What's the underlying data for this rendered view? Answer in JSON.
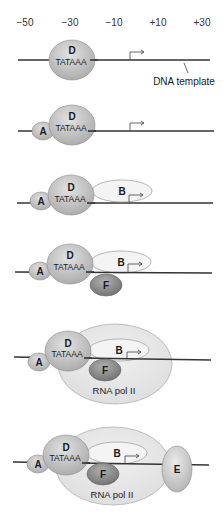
{
  "diagram": {
    "positions": [
      "−50",
      "−30",
      "−10",
      "+10",
      "+30"
    ],
    "dna_label": "DNA template",
    "tata_label": "TATAAA",
    "factors": {
      "A": "A",
      "B": "B",
      "D": "D",
      "E": "E",
      "F": "F",
      "pol": "RNA pol II"
    },
    "steps": [
      {
        "step": 1,
        "components": [
          "D"
        ]
      },
      {
        "step": 2,
        "components": [
          "A",
          "D"
        ]
      },
      {
        "step": 3,
        "components": [
          "A",
          "D",
          "B"
        ]
      },
      {
        "step": 4,
        "components": [
          "A",
          "D",
          "B",
          "F"
        ]
      },
      {
        "step": 5,
        "components": [
          "A",
          "D",
          "B",
          "F",
          "RNA pol II"
        ]
      },
      {
        "step": 6,
        "components": [
          "A",
          "D",
          "B",
          "F",
          "RNA pol II",
          "E"
        ]
      }
    ],
    "colors": {
      "dna": "#333333",
      "D": "#c4c4c4",
      "A": "#c8c8c8",
      "B": "#f2f2f2",
      "F": "#8a8a8a",
      "pol": "#e6e6e6",
      "E": "#d0d0d0",
      "outline": "#8c8c8c"
    }
  }
}
